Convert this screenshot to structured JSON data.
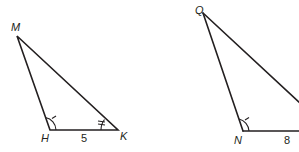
{
  "diagram": {
    "triangles": [
      {
        "name": "MHK",
        "vertices": {
          "M": {
            "label": "M",
            "x": 17,
            "y": 36
          },
          "H": {
            "label": "H",
            "x": 50,
            "y": 130
          },
          "K": {
            "label": "K",
            "x": 118,
            "y": 130
          }
        },
        "side_labels": [
          {
            "side": "HK",
            "value": "5"
          }
        ],
        "angle_marks": [
          {
            "vertex": "H",
            "arcs": 1,
            "ticks": 1
          },
          {
            "vertex": "K",
            "arcs": 1,
            "ticks": 2
          }
        ]
      },
      {
        "name": "QNR",
        "vertices": {
          "Q": {
            "label": "Q",
            "x": 203,
            "y": 13
          },
          "N": {
            "label": "N",
            "x": 243,
            "y": 131
          }
        },
        "side_labels": [
          {
            "side": "N-right",
            "value": "8"
          }
        ],
        "angle_marks": [
          {
            "vertex": "N",
            "arcs": 1,
            "ticks": 1
          }
        ]
      }
    ],
    "colors": {
      "stroke": "#231f20",
      "background": "#ffffff"
    }
  }
}
